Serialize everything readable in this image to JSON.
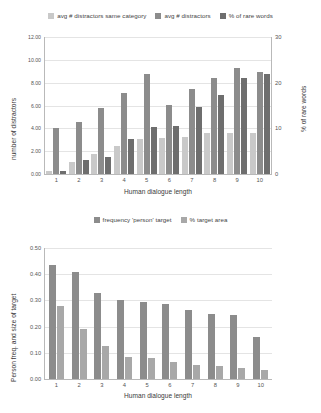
{
  "colors": {
    "series1": "#c9c9c9",
    "series2": "#8c8c8c",
    "series3": "#6e6e6e",
    "b_series1": "#8c8c8c",
    "b_series2": "#a8a8a8",
    "axis": "#b9b9b9",
    "grid": "#e4e4e4",
    "text": "#3a3a3a"
  },
  "chart_data": [
    {
      "id": "top",
      "type": "bar",
      "title": "",
      "xlabel": "Human dialogue length",
      "ylabel": "number of distractors",
      "y2label": "% of rare words",
      "categories": [
        "1",
        "2",
        "3",
        "4",
        "5",
        "6",
        "7",
        "8",
        "9",
        "10"
      ],
      "ylim": [
        0,
        12
      ],
      "yticks": [
        "0.00",
        "2.00",
        "4.00",
        "6.00",
        "8.00",
        "10.00",
        "12.00"
      ],
      "ytickvalues": [
        0,
        2,
        4,
        6,
        8,
        10,
        12
      ],
      "y2lim": [
        0,
        30
      ],
      "y2ticks": [
        "0",
        "10",
        "20",
        "30"
      ],
      "y2tickvalues": [
        0,
        10,
        20,
        30
      ],
      "grid": true,
      "legend_position": "top",
      "series": [
        {
          "name": "avg # distractors same category",
          "axis": "left",
          "values": [
            0.25,
            1.05,
            1.75,
            2.45,
            3.05,
            3.15,
            3.2,
            3.55,
            3.6,
            3.6
          ]
        },
        {
          "name": "avg # distractors",
          "axis": "left",
          "values": [
            4.0,
            4.55,
            5.8,
            7.1,
            8.75,
            6.05,
            7.45,
            8.45,
            9.3,
            8.95
          ]
        },
        {
          "name": "% of rare words",
          "axis": "right",
          "values": [
            0.6,
            3.1,
            3.7,
            7.6,
            10.3,
            10.6,
            14.6,
            17.2,
            21.0,
            22.0
          ]
        }
      ]
    },
    {
      "id": "bottom",
      "type": "bar",
      "title": "",
      "xlabel": "Human dialogue length",
      "ylabel": "Person freq. and size of target",
      "categories": [
        "1",
        "2",
        "3",
        "4",
        "5",
        "6",
        "7",
        "8",
        "9",
        "10"
      ],
      "ylim": [
        0,
        0.5
      ],
      "yticks": [
        "0.00",
        "0.10",
        "0.20",
        "0.30",
        "0.40",
        "0.50"
      ],
      "ytickvalues": [
        0,
        0.1,
        0.2,
        0.3,
        0.4,
        0.5
      ],
      "grid": true,
      "legend_position": "top",
      "series": [
        {
          "name": "frequency 'person' target",
          "values": [
            0.435,
            0.41,
            0.33,
            0.3,
            0.295,
            0.285,
            0.265,
            0.25,
            0.245,
            0.16
          ]
        },
        {
          "name": "% target area",
          "values": [
            0.28,
            0.19,
            0.125,
            0.085,
            0.08,
            0.065,
            0.055,
            0.05,
            0.042,
            0.035
          ]
        }
      ]
    }
  ]
}
